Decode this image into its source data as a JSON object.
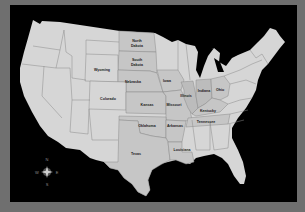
{
  "map": {
    "title": "United States map",
    "colors": {
      "border": "#6f6f6f",
      "background": "#000000",
      "land": "#d6d6d6",
      "highlight": "#c6c6c6",
      "highlight_dark": "#bcbcbc",
      "state_lines": "#8a8a8a",
      "label": "#1a1a1a"
    },
    "labeled_states": [
      {
        "id": "north-dakota",
        "line1": "North",
        "line2": "Dakota"
      },
      {
        "id": "south-dakota",
        "line1": "South",
        "line2": "Dakota"
      },
      {
        "id": "wyoming",
        "line1": "Wyoming"
      },
      {
        "id": "nebraska",
        "line1": "Nebraska"
      },
      {
        "id": "iowa",
        "line1": "Iowa"
      },
      {
        "id": "colorado",
        "line1": "Colorado"
      },
      {
        "id": "kansas",
        "line1": "Kansas"
      },
      {
        "id": "missouri",
        "line1": "Missouri"
      },
      {
        "id": "illinois",
        "line1": "Illinois"
      },
      {
        "id": "indiana",
        "line1": "Indiana"
      },
      {
        "id": "ohio",
        "line1": "Ohio"
      },
      {
        "id": "kentucky",
        "line1": "Kentucky"
      },
      {
        "id": "tennessee",
        "line1": "Tennessee"
      },
      {
        "id": "oklahoma",
        "line1": "Oklahoma"
      },
      {
        "id": "arkansas",
        "line1": "Arkansas"
      },
      {
        "id": "texas",
        "line1": "Texas"
      },
      {
        "id": "louisiana",
        "line1": "Louisiana"
      }
    ],
    "compass": {
      "n": "N",
      "s": "S",
      "e": "E",
      "w": "W"
    }
  }
}
